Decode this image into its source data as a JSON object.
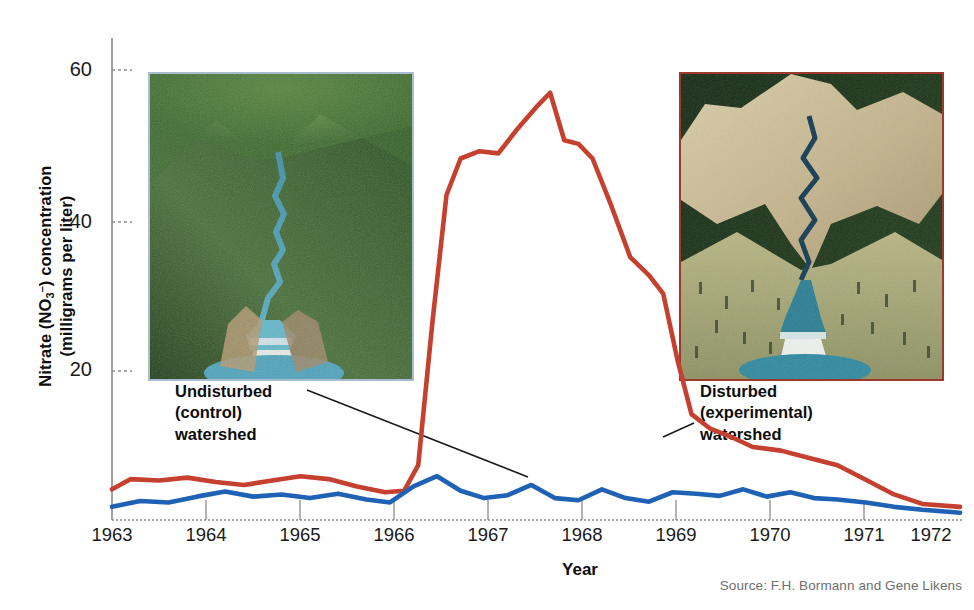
{
  "axes": {
    "ylabel_line1": "Nitrate (NO",
    "ylabel_sub": "3",
    "ylabel_sup": "–",
    "ylabel_line1_end": ") concentration",
    "ylabel_line2": "(milligrams per liter)",
    "ylabel_full": "Nitrate (NO3-) concentration (milligrams per liter)",
    "xlabel": "Year",
    "yticks": [
      "20",
      "40",
      "60"
    ],
    "xticks": [
      "1963",
      "1964",
      "1965",
      "1966",
      "1967",
      "1968",
      "1969",
      "1970",
      "1971",
      "1972"
    ]
  },
  "annotations": {
    "left": {
      "line1": "Undisturbed",
      "line2": "(control)",
      "line3": "watershed"
    },
    "right": {
      "line1": "Disturbed",
      "line2": "(experimental)",
      "line3": "watershed"
    }
  },
  "source": "Source: F.H. Bormann and Gene Likens",
  "photos": {
    "left": {
      "name": "undisturbed-forested-watershed-aerial-photo",
      "border_color": "#a8bdd0"
    },
    "right": {
      "name": "deforested-experimental-watershed-aerial-photo",
      "border_color": "#9b3a2c"
    }
  },
  "colors": {
    "disturbed_line": "#c5402f",
    "undisturbed_line": "#1f62b5",
    "axis": "#888888",
    "text": "#1a1a1a",
    "source_text": "#6e6e6e"
  },
  "chart_data": {
    "type": "line",
    "title": "",
    "xlabel": "Year",
    "ylabel": "Nitrate (NO3-) concentration (milligrams per liter)",
    "xlim": [
      1963.0,
      1972.0
    ],
    "ylim": [
      0,
      66
    ],
    "yticks": [
      20,
      40,
      60
    ],
    "xticks": [
      1963,
      1964,
      1965,
      1966,
      1967,
      1968,
      1969,
      1970,
      1971,
      1972
    ],
    "grid": false,
    "legend": "annotated-inline",
    "series": [
      {
        "name": "Disturbed (experimental) watershed",
        "color": "#c5402f",
        "x": [
          1963.0,
          1963.2,
          1963.5,
          1963.8,
          1964.1,
          1964.4,
          1964.7,
          1965.0,
          1965.3,
          1965.6,
          1965.9,
          1966.1,
          1966.25,
          1966.4,
          1966.55,
          1966.7,
          1966.9,
          1967.1,
          1967.3,
          1967.5,
          1967.65,
          1967.8,
          1967.95,
          1968.1,
          1968.3,
          1968.5,
          1968.7,
          1968.85,
          1969.0,
          1969.15,
          1969.35,
          1969.55,
          1969.8,
          1970.1,
          1970.4,
          1970.7,
          1971.0,
          1971.3,
          1971.6,
          1972.0
        ],
        "y": [
          4.2,
          5.6,
          5.4,
          5.8,
          5.2,
          4.8,
          5.4,
          6.0,
          5.6,
          4.6,
          3.8,
          4.0,
          7.5,
          27.0,
          44.5,
          49.5,
          50.5,
          50.2,
          53.5,
          56.5,
          58.5,
          52.0,
          51.5,
          49.5,
          43.0,
          36.0,
          33.5,
          31.0,
          22.0,
          14.5,
          12.5,
          11.5,
          10.0,
          9.5,
          8.5,
          7.5,
          5.5,
          3.5,
          2.2,
          1.8
        ]
      },
      {
        "name": "Undisturbed (control) watershed",
        "color": "#1f62b5",
        "x": [
          1963.0,
          1963.3,
          1963.6,
          1963.9,
          1964.2,
          1964.5,
          1964.8,
          1965.1,
          1965.4,
          1965.7,
          1965.95,
          1966.2,
          1966.45,
          1966.7,
          1966.95,
          1967.2,
          1967.45,
          1967.7,
          1967.95,
          1968.2,
          1968.45,
          1968.7,
          1968.95,
          1969.2,
          1969.45,
          1969.7,
          1969.95,
          1970.2,
          1970.45,
          1970.7,
          1971.0,
          1971.3,
          1971.6,
          1972.0
        ],
        "y": [
          1.8,
          2.6,
          2.4,
          3.2,
          3.9,
          3.2,
          3.5,
          3.0,
          3.6,
          2.8,
          2.4,
          4.6,
          6.0,
          4.0,
          3.0,
          3.4,
          4.8,
          3.0,
          2.7,
          4.2,
          3.0,
          2.5,
          3.8,
          3.6,
          3.3,
          4.2,
          3.2,
          3.8,
          3.0,
          2.8,
          2.4,
          1.8,
          1.4,
          1.0
        ]
      }
    ]
  }
}
